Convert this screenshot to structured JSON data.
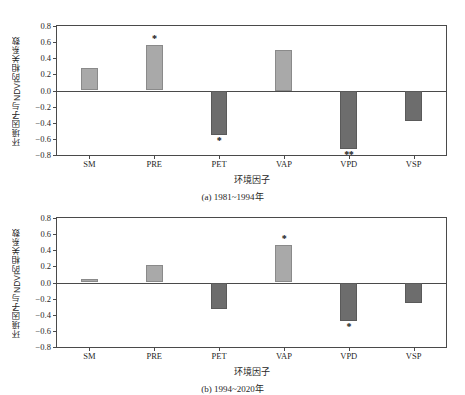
{
  "figure": {
    "faint_top_text": "",
    "yaxis_title": "环境因子与NDVI的相关系数",
    "xaxis_title": "环境因子",
    "caption_a": "(a) 1981~1994年",
    "caption_b": "(b) 1994~2020年",
    "colors": {
      "positive_bar": "#a9a9a9",
      "negative_bar": "#6d6d6d",
      "axis": "#4a4a4a",
      "text": "#1f1f1f",
      "background": "#ffffff"
    }
  },
  "chart_data": [
    {
      "type": "bar",
      "title": "(a) 1981~1994年",
      "xlabel": "环境因子",
      "ylabel": "环境因子与NDVI的相关系数",
      "categories": [
        "SM",
        "PRE",
        "PET",
        "VAP",
        "VPD",
        "VSP"
      ],
      "values": [
        0.28,
        0.57,
        -0.55,
        0.5,
        -0.73,
        -0.38
      ],
      "annotations": [
        "",
        "*",
        "*",
        "",
        "**",
        ""
      ],
      "ylim": [
        -0.8,
        0.8
      ],
      "yticks": [
        "0.8",
        "0.6",
        "0.4",
        "0.2",
        "0.0",
        "-0.2",
        "-0.4",
        "-0.6",
        "-0.8"
      ],
      "ytick_values": [
        0.8,
        0.6,
        0.4,
        0.2,
        0.0,
        -0.2,
        -0.4,
        -0.6,
        -0.8
      ],
      "grid": false,
      "legend": "none"
    },
    {
      "type": "bar",
      "title": "(b) 1994~2020年",
      "xlabel": "环境因子",
      "ylabel": "环境因子与NDVI的相关系数",
      "categories": [
        "SM",
        "PRE",
        "PET",
        "VAP",
        "VPD",
        "VSP"
      ],
      "values": [
        0.04,
        0.22,
        -0.33,
        0.47,
        -0.48,
        -0.26
      ],
      "annotations": [
        "",
        "",
        "",
        "*",
        "*",
        ""
      ],
      "ylim": [
        -0.8,
        0.8
      ],
      "yticks": [
        "0.8",
        "0.6",
        "0.4",
        "0.2",
        "0.0",
        "-0.2",
        "-0.4",
        "-0.6",
        "-0.8"
      ],
      "ytick_values": [
        0.8,
        0.6,
        0.4,
        0.2,
        0.0,
        -0.2,
        -0.4,
        -0.6,
        -0.8
      ],
      "grid": false,
      "legend": "none"
    }
  ]
}
